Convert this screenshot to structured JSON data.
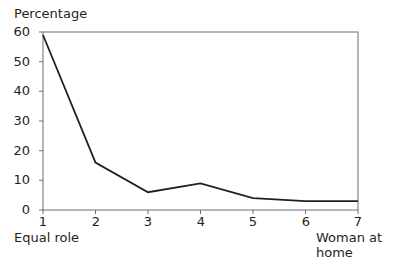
{
  "chart_data": {
    "type": "line",
    "title": "",
    "xlabel_left": "Equal role",
    "xlabel_right": "Woman at home",
    "ylabel": "Percentage",
    "x": [
      1,
      2,
      3,
      4,
      5,
      6,
      7
    ],
    "series": [
      {
        "name": "Percentage",
        "values": [
          59,
          16,
          6,
          9,
          4,
          3,
          3
        ]
      }
    ],
    "xlim": [
      1,
      7
    ],
    "ylim": [
      0,
      60
    ],
    "yticks": [
      0,
      10,
      20,
      30,
      40,
      50,
      60
    ],
    "xticks": [
      1,
      2,
      3,
      4,
      5,
      6,
      7
    ],
    "grid": false,
    "legend": null,
    "line_color": "#231f20"
  }
}
